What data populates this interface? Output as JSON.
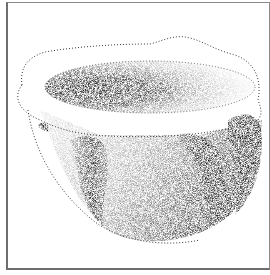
{
  "illustration": {
    "subject": "stippled stone mortar bowl with lugs",
    "colors": {
      "ink": "#111111",
      "paper": "#ffffff",
      "frame": "#7a7a7a"
    }
  }
}
